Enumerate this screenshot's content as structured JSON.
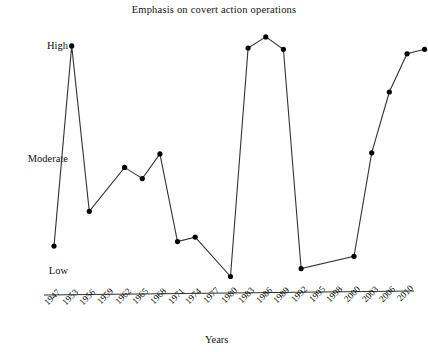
{
  "chart_data": {
    "type": "line",
    "title": "Emphasis on covert action operations",
    "xlabel": "Years",
    "ylabel": "",
    "ytick_labels": [
      "High",
      "Moderate",
      "Low"
    ],
    "ytick_values": [
      3,
      2,
      1
    ],
    "ylim": [
      0.85,
      3.15
    ],
    "grid": false,
    "legend": null,
    "marker": "filled-circle",
    "line_color": "#222222",
    "marker_color": "#000000",
    "categories": [
      "1947",
      "1953",
      "1956",
      "1959",
      "1962",
      "1965",
      "1968",
      "1971",
      "1974",
      "1977",
      "1980",
      "1983",
      "1986",
      "1989",
      "1992",
      "1995",
      "1998",
      "2000",
      "2003",
      "2006",
      "2010"
    ],
    "points": [
      {
        "x": "1947",
        "y": 1.23
      },
      {
        "x": "1953",
        "y": 3.01
      },
      {
        "x": "1956",
        "y": 1.54
      },
      {
        "x": "1962",
        "y": 1.93
      },
      {
        "x": "1965",
        "y": 1.83
      },
      {
        "x": "1968",
        "y": 2.05
      },
      {
        "x": "1971",
        "y": 1.27
      },
      {
        "x": "1974",
        "y": 1.31
      },
      {
        "x": "1980",
        "y": 0.96
      },
      {
        "x": "1983",
        "y": 2.99
      },
      {
        "x": "1986",
        "y": 3.09
      },
      {
        "x": "1989",
        "y": 2.98
      },
      {
        "x": "1992",
        "y": 1.03
      },
      {
        "x": "2000",
        "y": 1.14
      },
      {
        "x": "2003",
        "y": 2.06
      },
      {
        "x": "2006",
        "y": 2.6
      },
      {
        "x": "2010",
        "y": 2.94
      },
      {
        "x": "2010+",
        "y": 2.98
      }
    ]
  },
  "chart": {
    "title": "Emphasis on covert action operations",
    "axis_title_x": "Years",
    "y_high": "High",
    "y_moderate": "Moderate",
    "y_low": "Low",
    "ticks": [
      "1947",
      "1953",
      "1956",
      "1959",
      "1962",
      "1965",
      "1968",
      "1971",
      "1974",
      "1977",
      "1980",
      "1983",
      "1986",
      "1989",
      "1992",
      "1995",
      "1998",
      "2000",
      "2003",
      "2006",
      "2010"
    ]
  }
}
